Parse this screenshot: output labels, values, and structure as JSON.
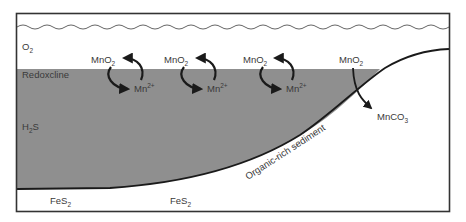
{
  "diagram": {
    "colors": {
      "anoxic_water": "#8f8f8f",
      "oxic_water": "#ffffff",
      "outline": "#222222",
      "arrow": "#1a1a1a",
      "text": "#3a3a3a"
    },
    "zones": {
      "oxic": {
        "label": "O",
        "sub": "2"
      },
      "redoxcline": {
        "label": "Redoxcline"
      },
      "sulfidic": {
        "label": "H",
        "sub": "2",
        "suffix": "S"
      }
    },
    "cycles": [
      {
        "oxidized": {
          "base": "MnO",
          "sub": "2"
        },
        "reduced": {
          "base": "Mn",
          "sup": "2+"
        }
      },
      {
        "oxidized": {
          "base": "MnO",
          "sub": "2"
        },
        "reduced": {
          "base": "Mn",
          "sup": "2+"
        }
      },
      {
        "oxidized": {
          "base": "MnO",
          "sub": "2"
        },
        "reduced": {
          "base": "Mn",
          "sup": "2+"
        }
      }
    ],
    "burial": {
      "source": {
        "base": "MnO",
        "sub": "2"
      },
      "product": {
        "base": "MnCO",
        "sub": "3"
      }
    },
    "sediment": {
      "label": "Organic-rich sediment",
      "minerals": [
        {
          "base": "FeS",
          "sub": "2"
        },
        {
          "base": "FeS",
          "sub": "2"
        }
      ]
    }
  }
}
